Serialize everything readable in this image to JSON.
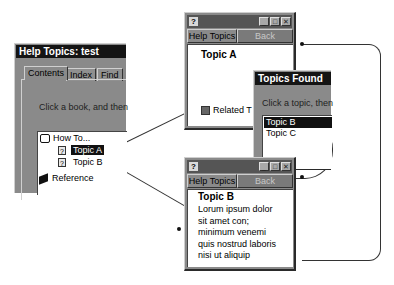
{
  "help_topics_window": {
    "title": "Help Topics: test",
    "tabs": [
      {
        "label": "Contents",
        "active": true
      },
      {
        "label": "Index",
        "active": false
      },
      {
        "label": "Find",
        "active": false
      }
    ],
    "instruction": "Click a book, and then",
    "tree": [
      {
        "label": "How To...",
        "icon": "open-book-icon",
        "level": 0
      },
      {
        "label": "Topic A",
        "icon": "help-page-icon",
        "level": 1,
        "selected": true
      },
      {
        "label": "Topic B",
        "icon": "help-page-icon",
        "level": 1,
        "selected": false
      },
      {
        "label": "Reference",
        "icon": "closed-book-icon",
        "level": 0
      }
    ]
  },
  "topic_a_window": {
    "title_icon": "?",
    "buttons": {
      "help_topics": "Help Topics",
      "back": "Back"
    },
    "heading": "Topic A",
    "related_label": "Related T"
  },
  "topics_found_window": {
    "title": "Topics Found",
    "instruction": "Click a topic, then",
    "items": [
      {
        "label": "Topic B",
        "selected": true
      },
      {
        "label": "Topic C",
        "selected": false
      }
    ]
  },
  "topic_b_window": {
    "title_icon": "?",
    "buttons": {
      "help_topics": "Help Topics",
      "back": "Back"
    },
    "heading": "Topic B",
    "body_lines": [
      "Lorum ipsum dolor",
      "sit amet con;",
      "minimum venemi",
      "quis nostrud laboris",
      "nisi ut aliquip"
    ]
  },
  "window_controls": {
    "minimize": "_",
    "maximize": "□",
    "close": "✕"
  }
}
